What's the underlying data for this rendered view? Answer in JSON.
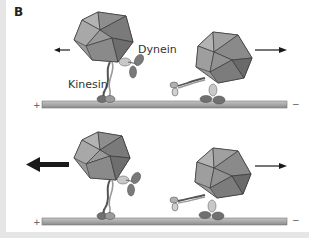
{
  "figure": {
    "panel_label": "B",
    "labels": {
      "kinesin": "Kinesin",
      "dynein": "Dynein"
    },
    "microtubule": {
      "plus_end": "+",
      "minus_end": "−"
    },
    "colors": {
      "cargo_light": "#a6a6a6",
      "cargo_mid": "#8c8c8c",
      "cargo_dark": "#6e6e6e",
      "motor_dark": "#6b6b6b",
      "motor_light": "#c8c8c8",
      "microtubule": "#a8a8a8",
      "arrow": "#1a1a1a"
    },
    "rows": [
      {
        "name": "top",
        "cargos": [
          {
            "position": "left",
            "direction": "left",
            "arrow_weight": "thin",
            "dominant_motor": "kinesin"
          },
          {
            "position": "right",
            "direction": "right",
            "arrow_weight": "thin",
            "dominant_motor": "dynein"
          }
        ]
      },
      {
        "name": "bottom",
        "cargos": [
          {
            "position": "left",
            "direction": "left",
            "arrow_weight": "thick",
            "dominant_motor": "kinesin"
          },
          {
            "position": "right",
            "direction": "right",
            "arrow_weight": "thin",
            "dominant_motor": "dynein"
          }
        ]
      }
    ]
  }
}
